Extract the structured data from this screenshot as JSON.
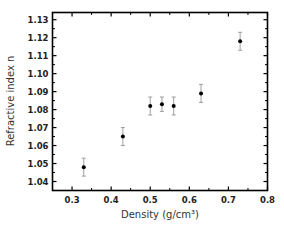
{
  "chart_data": {
    "type": "scatter",
    "title": "",
    "xlabel": "Density (g/cm³)",
    "ylabel": "Refractive index n",
    "xlim": [
      0.25,
      0.8
    ],
    "ylim": [
      1.035,
      1.134
    ],
    "xticks": [
      0.3,
      0.4,
      0.5,
      0.6,
      0.7,
      0.8
    ],
    "xtick_labels": [
      "0.3",
      "0.4",
      "0.5",
      "0.6",
      "0.7",
      "0.8"
    ],
    "yticks": [
      1.04,
      1.05,
      1.06,
      1.07,
      1.08,
      1.09,
      1.1,
      1.11,
      1.12,
      1.13
    ],
    "ytick_labels": [
      "1.04",
      "1.05",
      "1.06",
      "1.07",
      "1.08",
      "1.09",
      "1.10",
      "1.11",
      "1.12",
      "1.13"
    ],
    "grid": false,
    "legend": null,
    "series": [
      {
        "name": "Refractive index vs density",
        "marker": "circle",
        "color": "#000000",
        "error_bar_color": "#888888",
        "points": [
          {
            "x": 0.33,
            "y": 1.048,
            "err": 0.005
          },
          {
            "x": 0.43,
            "y": 1.065,
            "err": 0.005
          },
          {
            "x": 0.5,
            "y": 1.082,
            "err": 0.005
          },
          {
            "x": 0.53,
            "y": 1.083,
            "err": 0.004
          },
          {
            "x": 0.56,
            "y": 1.082,
            "err": 0.005
          },
          {
            "x": 0.63,
            "y": 1.089,
            "err": 0.005
          },
          {
            "x": 0.73,
            "y": 1.118,
            "err": 0.005
          }
        ]
      }
    ]
  }
}
